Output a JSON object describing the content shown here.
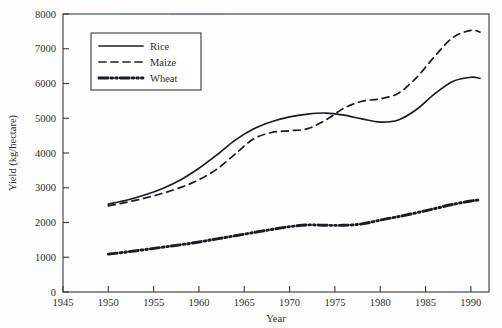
{
  "chart_data": {
    "type": "line",
    "title": "",
    "xlabel": "Year",
    "ylabel": "Yield (kg/hectare)",
    "xlim": [
      1945,
      1992
    ],
    "ylim": [
      0,
      8000
    ],
    "grid": false,
    "legend_position": "top-left-inside",
    "x_ticks": [
      1945,
      1950,
      1955,
      1960,
      1965,
      1970,
      1975,
      1980,
      1985,
      1990
    ],
    "y_ticks": [
      0,
      1000,
      2000,
      3000,
      4000,
      5000,
      6000,
      7000,
      8000
    ],
    "x_tick_labels": [
      "1945",
      "1950",
      "1955",
      "1960",
      "1965",
      "1970",
      "1975",
      "1980",
      "1985",
      "1990"
    ],
    "y_tick_labels": [
      "0",
      "1000",
      "2000",
      "3000",
      "4000",
      "5000",
      "6000",
      "7000",
      "8000"
    ],
    "x": [
      1950,
      1952,
      1954,
      1956,
      1958,
      1960,
      1962,
      1964,
      1966,
      1968,
      1970,
      1972,
      1974,
      1976,
      1978,
      1980,
      1982,
      1984,
      1986,
      1988,
      1990,
      1991
    ],
    "series": [
      {
        "name": "Rice",
        "style": "solid",
        "values": [
          2530,
          2640,
          2790,
          2980,
          3230,
          3560,
          3950,
          4370,
          4690,
          4900,
          5040,
          5120,
          5150,
          5090,
          4980,
          4890,
          4950,
          5250,
          5700,
          6060,
          6180,
          6150
        ]
      },
      {
        "name": "Maize",
        "style": "dashed",
        "values": [
          2480,
          2580,
          2700,
          2840,
          3010,
          3230,
          3540,
          3970,
          4400,
          4590,
          4640,
          4700,
          4950,
          5290,
          5490,
          5560,
          5720,
          6170,
          6780,
          7320,
          7530,
          7480
        ]
      },
      {
        "name": "Wheat",
        "style": "dash-dot-dot",
        "values": [
          1090,
          1150,
          1220,
          1290,
          1360,
          1440,
          1530,
          1620,
          1710,
          1800,
          1880,
          1930,
          1920,
          1920,
          1960,
          2070,
          2170,
          2280,
          2400,
          2520,
          2620,
          2650
        ]
      }
    ],
    "legend_entries": [
      {
        "label": "Rice",
        "style": "solid"
      },
      {
        "label": "Maize",
        "style": "dashed"
      },
      {
        "label": "Wheat",
        "style": "dash-dot-dot"
      }
    ],
    "colors": {
      "line": "#1b1b22",
      "axis": "#3a3a3a",
      "text": "#2e2e2e",
      "background": "#fdfdfc"
    }
  }
}
